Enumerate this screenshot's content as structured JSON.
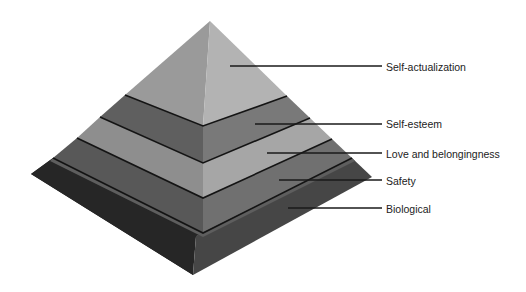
{
  "diagram": {
    "type": "pyramid",
    "orientation": "3d-isometric",
    "levels": [
      {
        "name": "Self-actualization",
        "rank": 5,
        "colors": {
          "left": "#9a9a9a",
          "right": "#b3b3b3"
        },
        "label_y": 67,
        "leader": {
          "x1": 230,
          "y1": 66,
          "x2": 382,
          "y2": 66
        }
      },
      {
        "name": "Self-esteem",
        "rank": 4,
        "colors": {
          "left": "#5f5f5f",
          "right": "#797979"
        },
        "label_y": 124,
        "leader": {
          "x1": 255,
          "y1": 124,
          "x2": 382,
          "y2": 124
        }
      },
      {
        "name": "Love and belongingness",
        "rank": 3,
        "colors": {
          "left": "#8e8e8e",
          "right": "#a6a6a6"
        },
        "label_y": 154,
        "leader": {
          "x1": 267,
          "y1": 153,
          "x2": 382,
          "y2": 153
        }
      },
      {
        "name": "Safety",
        "rank": 2,
        "colors": {
          "left": "#585858",
          "right": "#707070"
        },
        "label_y": 181,
        "leader": {
          "x1": 279,
          "y1": 180,
          "x2": 382,
          "y2": 180
        }
      },
      {
        "name": "Biological",
        "rank": 1,
        "colors": {
          "left": "#262626",
          "right": "#464646"
        },
        "label_y": 209,
        "leader": {
          "x1": 288,
          "y1": 208,
          "x2": 382,
          "y2": 208
        }
      }
    ],
    "separator_color": "#141414",
    "leader_color": "#1a1a1a"
  }
}
